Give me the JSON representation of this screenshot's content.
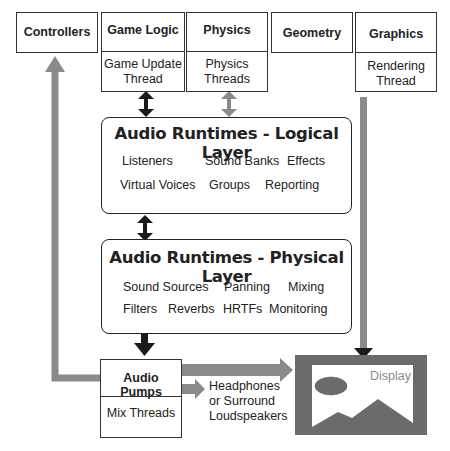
{
  "top_boxes": {
    "controllers": {
      "title": "Controllers"
    },
    "game_logic": {
      "title": "Game Logic",
      "sub1": "Game Update",
      "sub2": "Thread"
    },
    "physics": {
      "title": "Physics",
      "sub1": "Physics",
      "sub2": "Threads"
    },
    "geometry": {
      "title": "Geometry"
    },
    "graphics": {
      "title": "Graphics",
      "sub1": "Rendering",
      "sub2": "Thread"
    }
  },
  "logical_layer": {
    "title": "Audio Runtimes - Logical Layer",
    "items": [
      "Listeners",
      "Sound Banks",
      "Effects",
      "Virtual Voices",
      "Groups",
      "Reporting"
    ]
  },
  "physical_layer": {
    "title": "Audio Runtimes - Physical Layer",
    "items": [
      "Sound Sources",
      "Panning",
      "Mixing",
      "Filters",
      "Reverbs",
      "HRTFs",
      "Monitoring"
    ]
  },
  "audio_pumps": {
    "title": "Audio Pumps",
    "sub": "Mix Threads"
  },
  "output": {
    "line1": "Headphones",
    "line2": "or Surround",
    "line3": "Loudspeakers"
  },
  "display": {
    "label": "Display"
  },
  "colors": {
    "dark_arrow": "#1a1a1a",
    "gray_arrow": "#8a8a8a",
    "display_bg": "#6b6b6b",
    "border": "#333333"
  }
}
